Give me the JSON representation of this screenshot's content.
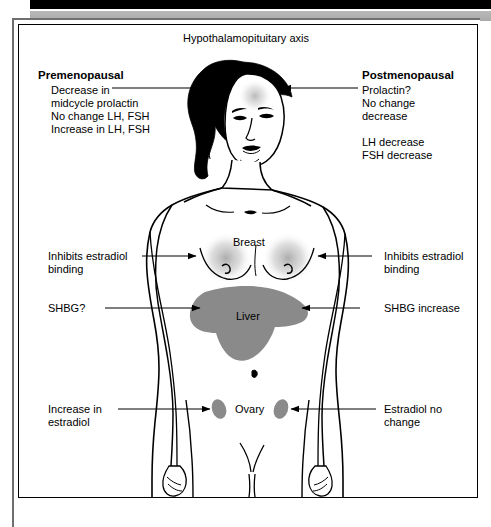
{
  "figure": {
    "title": "Hypothalamopituitary axis",
    "center_labels": [
      {
        "key": "breast",
        "text": "Breast"
      },
      {
        "key": "liver",
        "text": "Liver"
      },
      {
        "key": "ovary",
        "text": "Ovary"
      }
    ],
    "left_column": {
      "heading": "Premenopausal",
      "lines": [
        "Decrease in",
        "midcycle prolactin",
        "No change LH, FSH",
        "Increase in LH, FSH"
      ]
    },
    "right_column": {
      "heading": "Postmenopausal",
      "lines": [
        "Prolactin?",
        "No change",
        "decrease"
      ],
      "lines2": [
        "LH decrease",
        "FSH decrease"
      ]
    },
    "left_annotations": [
      {
        "key": "breast-left",
        "line1": "Inhibits estradiol",
        "line2": "binding"
      },
      {
        "key": "shbg-left",
        "line1": "SHBG?",
        "line2": ""
      },
      {
        "key": "ovary-left",
        "line1": "Increase in",
        "line2": "estradiol"
      }
    ],
    "right_annotations": [
      {
        "key": "breast-right",
        "line1": "Inhibits estradiol",
        "line2": "binding"
      },
      {
        "key": "shbg-right",
        "line1": "SHBG increase",
        "line2": ""
      },
      {
        "key": "ovary-right",
        "line1": "Estradiol no",
        "line2": "change"
      }
    ],
    "colors": {
      "ink": "#000000",
      "organ_gray": "#8a8a8a",
      "glow_gray": "#b5b5b5",
      "bar_black": "#000000",
      "bar_gray": "#b0b0b0",
      "frame_gray": "#6f6f6f"
    }
  }
}
